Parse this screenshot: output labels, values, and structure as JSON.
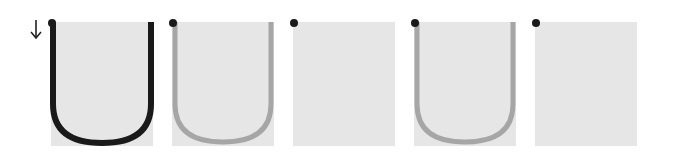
{
  "direction_icon": "down-arrow-icon",
  "colors": {
    "panel_bg": "#e6e6e6",
    "dot": "#1a1a1a",
    "stroke_dark": "#1a1a1a",
    "stroke_light": "#a6a6a6"
  },
  "panels": [
    {
      "index": 1,
      "shape": "u-curve",
      "stroke": "dark"
    },
    {
      "index": 2,
      "shape": "u-curve",
      "stroke": "light"
    },
    {
      "index": 3,
      "shape": "empty",
      "stroke": "none"
    },
    {
      "index": 4,
      "shape": "u-curve",
      "stroke": "light"
    },
    {
      "index": 5,
      "shape": "empty",
      "stroke": "none"
    }
  ]
}
